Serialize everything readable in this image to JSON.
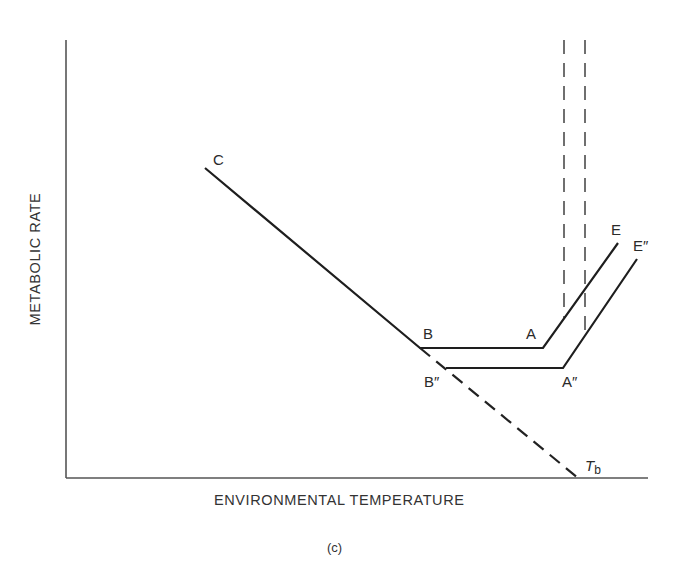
{
  "figure": {
    "caption": "(c)",
    "x_axis_label": "ENVIRONMENTAL TEMPERATURE",
    "y_axis_label": "METABOLIC RATE"
  },
  "points": {
    "C": {
      "label": "C"
    },
    "B": {
      "label": "B"
    },
    "A": {
      "label": "A"
    },
    "E": {
      "label": "E"
    },
    "B2": {
      "label": "B″"
    },
    "A2": {
      "label": "A″"
    },
    "E2": {
      "label": "E″"
    },
    "Tb": {
      "label": "T",
      "subscript": "b"
    }
  },
  "colors": {
    "line": "#1e1e1e",
    "axis": "#555555",
    "dashed": "#2a2a2a"
  },
  "curves": [
    {
      "name": "original",
      "style": "solid",
      "path": [
        "C",
        "B",
        "A",
        "E"
      ]
    },
    {
      "name": "shifted",
      "style": "solid",
      "path": [
        "B2",
        "A2",
        "E2"
      ]
    },
    {
      "name": "extrapolation",
      "style": "dashed",
      "path": [
        "B",
        "Tb"
      ]
    },
    {
      "name": "upper-critical-markers",
      "style": "dashed",
      "count": 2
    }
  ]
}
